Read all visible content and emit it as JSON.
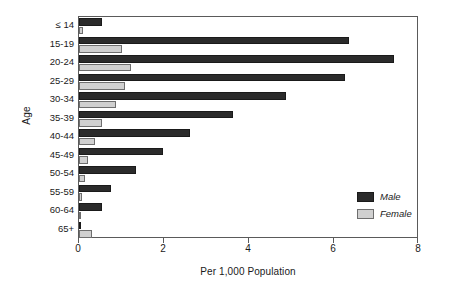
{
  "chart_data": {
    "type": "bar",
    "orientation": "horizontal",
    "grouped": true,
    "title": "",
    "xlabel": "Per 1,000 Population",
    "ylabel": "Age",
    "xlim": [
      0,
      8
    ],
    "xticks": [
      0,
      2,
      4,
      6,
      8
    ],
    "xtick_labels": [
      "0",
      "2",
      "4",
      "6",
      "8"
    ],
    "grid": false,
    "legend_position": "inside-right",
    "categories": [
      "≤ 14",
      "15-19",
      "20-24",
      "25-29",
      "30-34",
      "35-39",
      "40-44",
      "45-49",
      "50-54",
      "55-59",
      "60-64",
      "65+"
    ],
    "series": [
      {
        "name": "Male",
        "color": "#2b2b2b",
        "values": [
          0.54,
          6.35,
          7.4,
          6.25,
          4.87,
          3.62,
          2.6,
          1.97,
          1.34,
          0.75,
          0.54,
          0.05
        ]
      },
      {
        "name": "Female",
        "color": "#d0d0d0",
        "values": [
          0.1,
          1.0,
          1.22,
          1.08,
          0.87,
          0.54,
          0.38,
          0.22,
          0.15,
          0.08,
          0.03,
          0.3
        ]
      }
    ],
    "legend": [
      {
        "label": "Male",
        "swatch": "male"
      },
      {
        "label": "Female",
        "swatch": "female"
      }
    ]
  }
}
